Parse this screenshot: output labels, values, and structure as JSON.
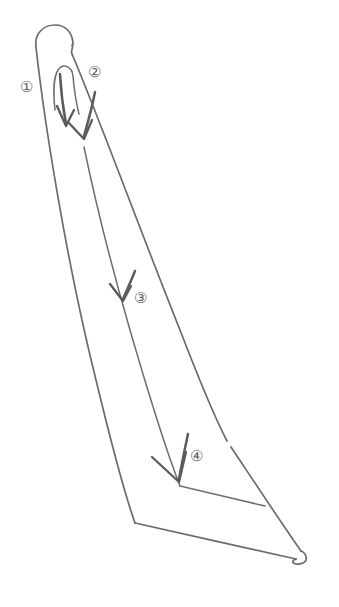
{
  "figure": {
    "background_color": "#ffffff",
    "stroke_color": "#6b6b6b",
    "arrow_color": "#5b5b5b",
    "label_color": "#5f5f5f",
    "width": 339,
    "height": 607
  },
  "callouts": [
    {
      "id": "callout-1",
      "label": "①",
      "x": 20,
      "y": 80,
      "note": "left side of nib body, near vent slot"
    },
    {
      "id": "callout-2",
      "label": "②",
      "x": 88,
      "y": 65,
      "note": "right shoulder of nib, start of slit"
    },
    {
      "id": "callout-3",
      "label": "③",
      "x": 134,
      "y": 291,
      "note": "mid-body slit"
    },
    {
      "id": "callout-4",
      "label": "④",
      "x": 190,
      "y": 449,
      "note": "lower tipping area"
    }
  ]
}
